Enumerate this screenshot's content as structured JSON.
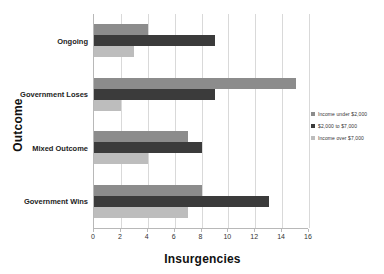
{
  "chart_data": {
    "type": "bar",
    "orientation": "horizontal",
    "title": "",
    "xlabel": "Insurgencies",
    "ylabel": "Outcome",
    "xlim": [
      0,
      16
    ],
    "xticks": [
      "0",
      "2",
      "4",
      "6",
      "8",
      "10",
      "12",
      "14",
      "16"
    ],
    "grid": "vertical",
    "legend_position": "right",
    "categories": [
      "Ongoing",
      "Government Loses",
      "Mixed Outcome",
      "Government Wins"
    ],
    "series": [
      {
        "name": "Income under $2,000",
        "color": "#8c8c8c",
        "values": [
          4,
          15,
          7,
          8
        ]
      },
      {
        "name": "$2,000 to $7,000",
        "color": "#3b3b3b",
        "values": [
          9,
          9,
          8,
          13
        ]
      },
      {
        "name": "Income over $7,000",
        "color": "#bdbdbd",
        "values": [
          3,
          2,
          4,
          7
        ]
      }
    ]
  },
  "axes": {
    "y_title": "Outcome",
    "x_title": "Insurgencies"
  },
  "legend": {
    "items": [
      {
        "label": "Income under $2,000",
        "color": "#8c8c8c"
      },
      {
        "label": "$2,000 to $7,000",
        "color": "#3b3b3b"
      },
      {
        "label": "Income over $7,000",
        "color": "#bdbdbd"
      }
    ]
  }
}
